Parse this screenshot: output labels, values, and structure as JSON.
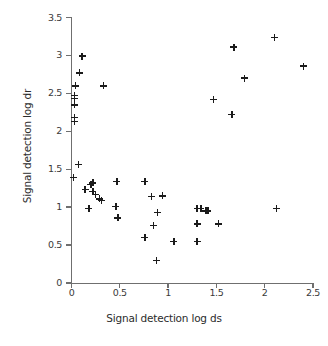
{
  "chart_data": {
    "type": "scatter",
    "title": "",
    "xlabel": "Signal detection log ds",
    "ylabel": "Signal detection log dr",
    "xlim": [
      0,
      2.5
    ],
    "ylim": [
      0,
      3.5
    ],
    "xticks": [
      0,
      0.5,
      1,
      1.5,
      2,
      2.5
    ],
    "xtick_labels": [
      "0",
      "0.5",
      "1",
      "1.5",
      "2",
      "2.5"
    ],
    "yticks": [
      0,
      0.5,
      1,
      1.5,
      2,
      2.5,
      3,
      3.5
    ],
    "ytick_labels": [
      "0",
      "0.5",
      "1",
      "1.5",
      "2",
      "2.5",
      "3",
      "3.5"
    ],
    "grid": false,
    "legend": null,
    "marker": "plus",
    "marker_color": "#1b1b1b",
    "series": [
      {
        "name": "observations",
        "points": [
          [
            0.04,
            2.6
          ],
          [
            0.03,
            2.47
          ],
          [
            0.03,
            2.43
          ],
          [
            0.03,
            2.35
          ],
          [
            0.03,
            2.18
          ],
          [
            0.03,
            2.13
          ],
          [
            0.02,
            1.39
          ],
          [
            0.07,
            1.56
          ],
          [
            0.11,
            2.99
          ],
          [
            0.08,
            2.77
          ],
          [
            0.33,
            2.6
          ],
          [
            0.14,
            1.23
          ],
          [
            0.2,
            1.3
          ],
          [
            0.22,
            1.32
          ],
          [
            0.22,
            1.21
          ],
          [
            0.25,
            1.17
          ],
          [
            0.29,
            1.11
          ],
          [
            0.31,
            1.09
          ],
          [
            0.18,
            0.98
          ],
          [
            0.47,
            1.34
          ],
          [
            0.46,
            1.01
          ],
          [
            0.48,
            0.86
          ],
          [
            0.76,
            1.34
          ],
          [
            0.83,
            1.14
          ],
          [
            0.94,
            1.15
          ],
          [
            0.89,
            0.93
          ],
          [
            0.85,
            0.76
          ],
          [
            0.76,
            0.6
          ],
          [
            0.88,
            0.3
          ],
          [
            1.06,
            0.55
          ],
          [
            1.3,
            0.98
          ],
          [
            1.34,
            0.98
          ],
          [
            1.39,
            0.95
          ],
          [
            1.41,
            0.95
          ],
          [
            1.3,
            0.78
          ],
          [
            1.3,
            0.55
          ],
          [
            1.52,
            0.78
          ],
          [
            1.47,
            2.42
          ],
          [
            1.68,
            3.11
          ],
          [
            1.66,
            2.22
          ],
          [
            1.79,
            2.7
          ],
          [
            2.1,
            3.24
          ],
          [
            2.12,
            0.98
          ],
          [
            2.4,
            2.86
          ]
        ]
      }
    ]
  }
}
